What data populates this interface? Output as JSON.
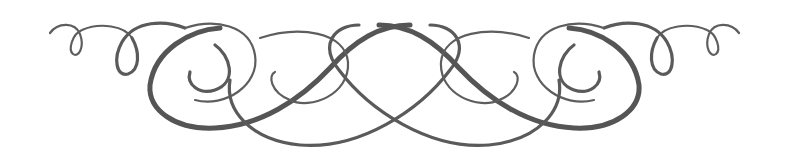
{
  "image": {
    "description": "Symmetric decorative calligraphic flourish divider",
    "ink_color": "#5a5a5a",
    "background": "#ffffff"
  }
}
